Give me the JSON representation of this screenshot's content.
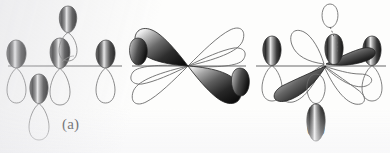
{
  "figure": {
    "background_color": "#fdfdfc",
    "lobe_fill_dark": "#1b1b1b",
    "lobe_fill_mid": "#6e6e6e",
    "lobe_highlight": "#f2f2f2",
    "outline_color": "#5a5a5a",
    "axis_color": "#6b6b6b",
    "label_color": "#23221f",
    "artifact_text": "",
    "panels": [
      {
        "id": "a",
        "label": "(a)",
        "description": "Set of p-type orbital pairs radiating from a common center on a horizontal axis: two horizontal orbitals pointing left and right, one vertical orbital pointing up, one vertical orbital pointing down, plus a small upper lobe above the center.",
        "shaded_lobe_count": 5,
        "outline_lobe_count": 5
      },
      {
        "id": "b",
        "label": "(b)",
        "description": "d-orbital-like arrangement: two large shaded lobes on the upper-left and lower-right diagonals with matching outline lobes on the upper-right and lower-left diagonals, plus small shaded lobes at the far left and far right along the horizontal axis.",
        "shaded_lobe_count": 4,
        "outline_lobe_count": 4
      },
      {
        "id": "c",
        "label": "(c)",
        "description": "Combination of the (a) and (b) sets superimposed: large shaded diagonal lobes together with vertical and horizontal p-type lobes and their outline counterparts about a shared center.",
        "shaded_lobe_count": 7,
        "outline_lobe_count": 7
      }
    ]
  }
}
